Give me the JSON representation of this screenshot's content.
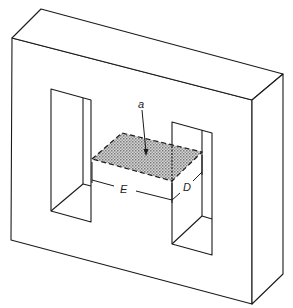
{
  "figure": {
    "labels": {
      "area": "a",
      "length": "E",
      "depth": "D"
    },
    "colors": {
      "line": "#1a1a1a",
      "shade": "#b8b8b8",
      "background": "#ffffff"
    }
  }
}
